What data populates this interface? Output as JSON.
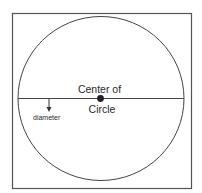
{
  "diagram": {
    "labels": {
      "center_line1": "Center of",
      "center_line2": "Circle",
      "diameter": "diameter"
    },
    "colors": {
      "stroke": "#3a3a3a",
      "background": "#ffffff"
    }
  }
}
